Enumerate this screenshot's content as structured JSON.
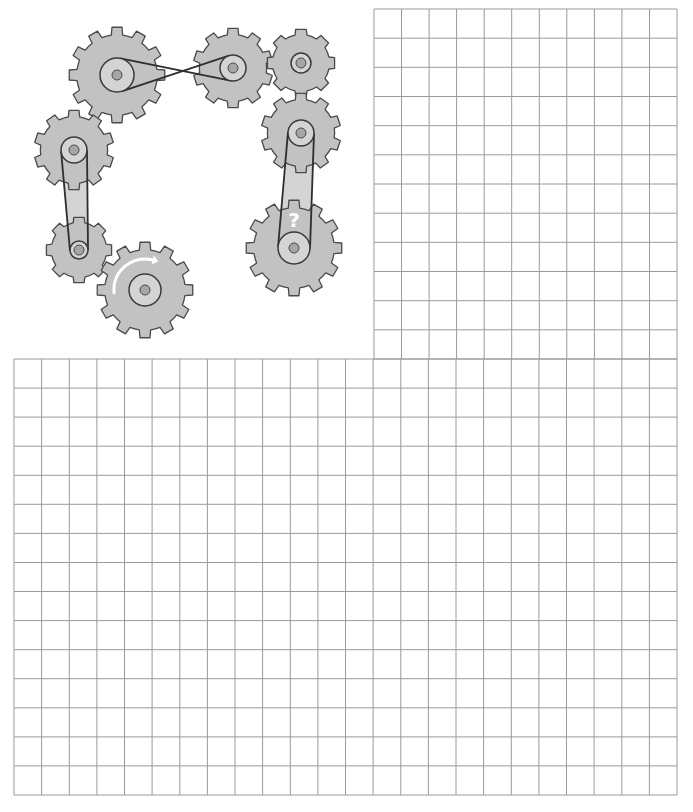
{
  "diagram": {
    "question_mark": "?",
    "colors": {
      "gear_fill": "#c2c2c2",
      "gear_stroke": "#4a4a4a",
      "pulley_fill": "#d4d4d4",
      "hub_fill": "#a6a6a6",
      "belt": "#2e2e2e",
      "grid": "#9a9a9a",
      "arrow": "#ffffff"
    },
    "gears": [
      {
        "id": "gear-1",
        "cx": 117,
        "cy": 75,
        "r_outer": 48,
        "teeth": 12,
        "pulley_r": 17,
        "hub_r": 5
      },
      {
        "id": "gear-2",
        "cx": 233,
        "cy": 68,
        "r_outer": 40,
        "teeth": 10,
        "pulley_r": 13,
        "hub_r": 5
      },
      {
        "id": "gear-3",
        "cx": 301,
        "cy": 63,
        "r_outer": 34,
        "teeth": 8,
        "pulley_r": 10,
        "hub_r": 5
      },
      {
        "id": "gear-4",
        "cx": 301,
        "cy": 133,
        "r_outer": 40,
        "teeth": 10,
        "pulley_r": 13,
        "hub_r": 5
      },
      {
        "id": "gear-5",
        "cx": 294,
        "cy": 248,
        "r_outer": 48,
        "teeth": 12,
        "pulley_r": 16,
        "hub_r": 5,
        "label": "?"
      },
      {
        "id": "gear-6",
        "cx": 74,
        "cy": 150,
        "r_outer": 40,
        "teeth": 10,
        "pulley_r": 13,
        "hub_r": 5
      },
      {
        "id": "gear-7",
        "cx": 79,
        "cy": 250,
        "r_outer": 33,
        "teeth": 8,
        "pulley_r": 9,
        "hub_r": 5
      },
      {
        "id": "gear-8",
        "cx": 145,
        "cy": 290,
        "r_outer": 48,
        "teeth": 12,
        "pulley_r": 16,
        "hub_r": 5,
        "arrow": "clockwise"
      }
    ],
    "belts": [
      {
        "id": "belt-1-2",
        "from": "gear-1",
        "to": "gear-2",
        "type": "crossed"
      },
      {
        "id": "belt-4-5",
        "from": "gear-4",
        "to": "gear-5",
        "type": "open"
      },
      {
        "id": "belt-6-7",
        "from": "gear-6",
        "to": "gear-7",
        "type": "open"
      }
    ]
  },
  "grid": {
    "top": {
      "x0": 374,
      "y0": 9,
      "x1": 677,
      "y1": 359,
      "cols": 11,
      "rows": 12
    },
    "bottom": {
      "x0": 14,
      "y0": 359,
      "x1": 677,
      "y1": 795,
      "cols": 24,
      "rows": 15
    }
  }
}
